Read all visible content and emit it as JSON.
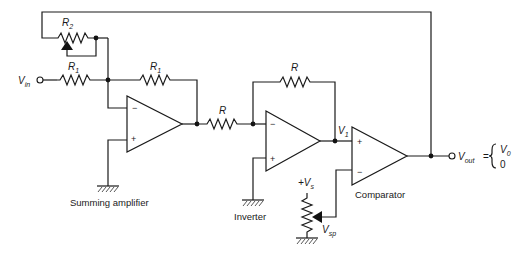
{
  "diagram": {
    "blocks": {
      "summing_amplifier": "Summing amplifier",
      "inverter": "Inverter",
      "comparator": "Comparator"
    },
    "labels": {
      "r2": "R",
      "r2_sub": "2",
      "r1_input": "R",
      "r1_input_sub": "1",
      "r1_feedback": "R",
      "r1_feedback_sub": "1",
      "r_series": "R",
      "r_inv_feedback": "R",
      "vin": "V",
      "vin_sub": "in",
      "v1": "V",
      "v1_sub": "1",
      "vs": "+V",
      "vs_sub": "s",
      "vsp": "V",
      "vsp_sub": "sp",
      "vout": "V",
      "vout_sub": "out",
      "equals": "=",
      "v0": "V",
      "v0_sub": "0",
      "zero": "0"
    },
    "opamp_signs": {
      "minus": "−",
      "plus": "+"
    }
  }
}
